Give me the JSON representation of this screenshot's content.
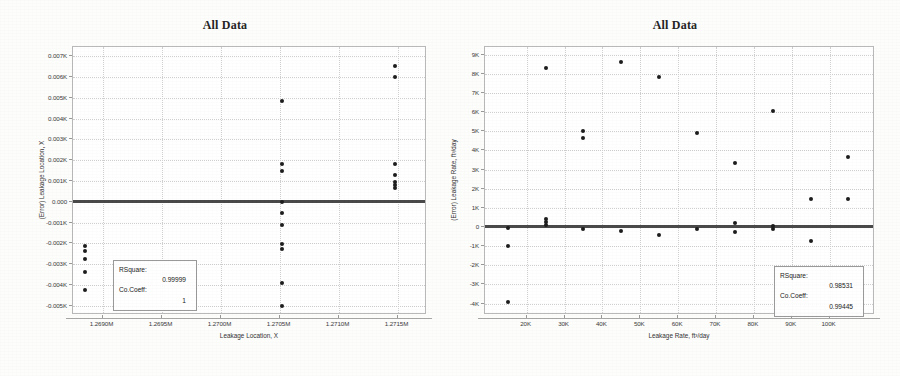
{
  "chart_data": [
    {
      "type": "scatter",
      "panel": "left",
      "title": "All Data",
      "xlabel": "Leakage Location, X",
      "ylabel": "(Error) Leakage Location, X",
      "grid": true,
      "legend": "none",
      "xlim": [
        1.26875,
        1.27175
      ],
      "ylim": [
        -0.00545,
        0.00745
      ],
      "xticks": [
        "1.2690M",
        "1.2695M",
        "1.2700M",
        "1.2705M",
        "1.2710M",
        "1.2715M"
      ],
      "xtick_values": [
        1.269,
        1.2695,
        1.27,
        1.2705,
        1.271,
        1.2715
      ],
      "yticks": [
        "0.007K",
        "0.006K",
        "0.005K",
        "0.004K",
        "0.003K",
        "0.002K",
        "0.001K",
        "0.000",
        "-0.001K",
        "-0.002K",
        "-0.003K",
        "-0.004K",
        "-0.005K"
      ],
      "ytick_values": [
        0.007,
        0.006,
        0.005,
        0.004,
        0.003,
        0.002,
        0.001,
        0.0,
        -0.001,
        -0.002,
        -0.003,
        -0.004,
        -0.005
      ],
      "reference_line_y": 0.0,
      "points": [
        {
          "x": 1.26885,
          "y": -0.00215
        },
        {
          "x": 1.26885,
          "y": -0.00235
        },
        {
          "x": 1.26885,
          "y": -0.00275
        },
        {
          "x": 1.26885,
          "y": -0.0034
        },
        {
          "x": 1.26885,
          "y": -0.00425
        },
        {
          "x": 1.27052,
          "y": 0.00485
        },
        {
          "x": 1.27052,
          "y": 0.00182
        },
        {
          "x": 1.27052,
          "y": 0.00146
        },
        {
          "x": 1.27052,
          "y": 0.0
        },
        {
          "x": 1.27052,
          "y": -0.00054
        },
        {
          "x": 1.27052,
          "y": -0.0011
        },
        {
          "x": 1.27052,
          "y": -0.00205
        },
        {
          "x": 1.27052,
          "y": -0.00228
        },
        {
          "x": 1.27052,
          "y": -0.00392
        },
        {
          "x": 1.27052,
          "y": -0.00503
        },
        {
          "x": 1.27148,
          "y": 0.00655
        },
        {
          "x": 1.27148,
          "y": 0.006
        },
        {
          "x": 1.27148,
          "y": 0.00182
        },
        {
          "x": 1.27148,
          "y": 0.00128
        },
        {
          "x": 1.27148,
          "y": 0.00097
        },
        {
          "x": 1.27148,
          "y": 0.00082
        },
        {
          "x": 1.27148,
          "y": 0.00066
        }
      ],
      "annotation": {
        "rsquare_label": "RSquare:",
        "rsquare_value": "0.99999",
        "coeff_label": "Co.Coeff:",
        "coeff_value": "1"
      }
    },
    {
      "type": "scatter",
      "panel": "right",
      "title": "All Data",
      "xlabel": "Leakage Rate, ft³/day",
      "ylabel": "(Error) Leakage Rate, ft³/day",
      "grid": true,
      "legend": "none",
      "xlim": [
        9000,
        112000
      ],
      "ylim": [
        -4600,
        9400
      ],
      "xticks": [
        "20K",
        "30K",
        "40K",
        "50K",
        "60K",
        "70K",
        "80K",
        "90K",
        "100K"
      ],
      "xtick_values": [
        20000,
        30000,
        40000,
        50000,
        60000,
        70000,
        80000,
        90000,
        100000
      ],
      "yticks": [
        "9K",
        "8K",
        "7K",
        "6K",
        "5K",
        "4K",
        "3K",
        "2K",
        "1K",
        "0",
        "-1K",
        "-2K",
        "-3K",
        "-4K"
      ],
      "ytick_values": [
        9000,
        8000,
        7000,
        6000,
        5000,
        4000,
        3000,
        2000,
        1000,
        0,
        -1000,
        -2000,
        -3000,
        -4000
      ],
      "reference_line_y": 0,
      "points": [
        {
          "x": 15000,
          "y": -1020
        },
        {
          "x": 15000,
          "y": -3930
        },
        {
          "x": 15000,
          "y": -30
        },
        {
          "x": 25000,
          "y": 8300
        },
        {
          "x": 25000,
          "y": 390
        },
        {
          "x": 25000,
          "y": 270
        },
        {
          "x": 25000,
          "y": 120
        },
        {
          "x": 35000,
          "y": 5000
        },
        {
          "x": 35000,
          "y": 4630
        },
        {
          "x": 35000,
          "y": -110
        },
        {
          "x": 45000,
          "y": 8620
        },
        {
          "x": 45000,
          "y": -200
        },
        {
          "x": 55000,
          "y": 7830
        },
        {
          "x": 55000,
          "y": -440
        },
        {
          "x": 65000,
          "y": 4900
        },
        {
          "x": 65000,
          "y": -100
        },
        {
          "x": 75000,
          "y": 3320
        },
        {
          "x": 75000,
          "y": 200
        },
        {
          "x": 75000,
          "y": -280
        },
        {
          "x": 85000,
          "y": 6080
        },
        {
          "x": 85000,
          "y": 60
        },
        {
          "x": 85000,
          "y": -130
        },
        {
          "x": 95000,
          "y": 1440
        },
        {
          "x": 95000,
          "y": -730
        },
        {
          "x": 105000,
          "y": 3660
        },
        {
          "x": 105000,
          "y": 1460
        }
      ],
      "annotation": {
        "rsquare_label": "RSquare:",
        "rsquare_value": "0.98531",
        "coeff_label": "Co.Coeff:",
        "coeff_value": "0.99445"
      }
    }
  ]
}
